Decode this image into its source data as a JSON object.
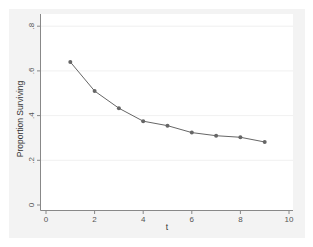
{
  "chart_data": {
    "type": "line",
    "title": "",
    "xlabel": "t",
    "ylabel": "Proportion Surviving",
    "x": [
      1,
      2,
      3,
      4,
      5,
      6,
      7,
      8,
      9
    ],
    "series": [
      {
        "name": "Proportion Surviving",
        "values": [
          0.64,
          0.51,
          0.433,
          0.375,
          0.355,
          0.324,
          0.31,
          0.303,
          0.282
        ],
        "color": "#666666",
        "marker": "circle"
      }
    ],
    "xlim": [
      0,
      10
    ],
    "ylim": [
      0,
      0.8
    ],
    "xticks": [
      0,
      2,
      4,
      6,
      8,
      10
    ],
    "xtick_labels": [
      "0",
      "2",
      "4",
      "6",
      "8",
      "10"
    ],
    "yticks": [
      0,
      0.2,
      0.4,
      0.6,
      0.8
    ],
    "ytick_labels": [
      "0",
      ".2",
      ".4",
      ".6",
      ".8"
    ],
    "grid": "horizontal",
    "legend": "none"
  },
  "colors": {
    "graph_background": "#f3f3f3",
    "plot_background": "#ffffff",
    "line": "#666666",
    "axis": "#888888",
    "grid": "#ececec"
  }
}
